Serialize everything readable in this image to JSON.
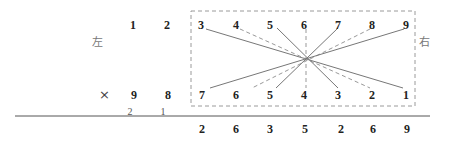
{
  "labels": {
    "left": "左",
    "right": "右",
    "multiply": "×"
  },
  "top_row": [
    {
      "digit": "1",
      "x": 133
    },
    {
      "digit": "2",
      "x": 167
    },
    {
      "digit": "3",
      "x": 201
    },
    {
      "digit": "4",
      "x": 236
    },
    {
      "digit": "5",
      "x": 270
    },
    {
      "digit": "6",
      "x": 304
    },
    {
      "digit": "7",
      "x": 338
    },
    {
      "digit": "8",
      "x": 372
    },
    {
      "digit": "9",
      "x": 406
    }
  ],
  "bottom_row": [
    {
      "digit": "9",
      "x": 134
    },
    {
      "digit": "8",
      "x": 168
    },
    {
      "digit": "7",
      "x": 202
    },
    {
      "digit": "6",
      "x": 236
    },
    {
      "digit": "5",
      "x": 270
    },
    {
      "digit": "4",
      "x": 304
    },
    {
      "digit": "3",
      "x": 338
    },
    {
      "digit": "2",
      "x": 372
    },
    {
      "digit": "1",
      "x": 406
    }
  ],
  "carries": [
    {
      "digit": "2",
      "x": 130
    },
    {
      "digit": "1",
      "x": 163
    }
  ],
  "result_row": [
    {
      "digit": "2",
      "x": 202
    },
    {
      "digit": "6",
      "x": 236
    },
    {
      "digit": "3",
      "x": 270
    },
    {
      "digit": "5",
      "x": 305
    },
    {
      "digit": "2",
      "x": 341
    },
    {
      "digit": "6",
      "x": 373
    },
    {
      "digit": "9",
      "x": 407
    }
  ],
  "cross_lines": [
    {
      "from": "3",
      "to": "1",
      "style": "solid",
      "x1": 206,
      "y1": 29,
      "x2": 403,
      "y2": 88
    },
    {
      "from": "4",
      "to": "2",
      "style": "dashed",
      "x1": 240,
      "y1": 29,
      "x2": 370,
      "y2": 88
    },
    {
      "from": "5",
      "to": "3",
      "style": "solid",
      "x1": 277,
      "y1": 28,
      "x2": 338,
      "y2": 88
    },
    {
      "from": "6",
      "to": "4",
      "style": "dashed",
      "x1": 306,
      "y1": 29,
      "x2": 306,
      "y2": 88
    },
    {
      "from": "7",
      "to": "5",
      "style": "solid",
      "x1": 338,
      "y1": 28,
      "x2": 276,
      "y2": 88
    },
    {
      "from": "8",
      "to": "6",
      "style": "dashed",
      "x1": 370,
      "y1": 29,
      "x2": 252,
      "y2": 88
    },
    {
      "from": "9",
      "to": "7",
      "style": "solid",
      "x1": 404,
      "y1": 29,
      "x2": 210,
      "y2": 88
    }
  ],
  "colors": {
    "line": "#777777",
    "dashed": "#999999",
    "text": "#222222"
  }
}
